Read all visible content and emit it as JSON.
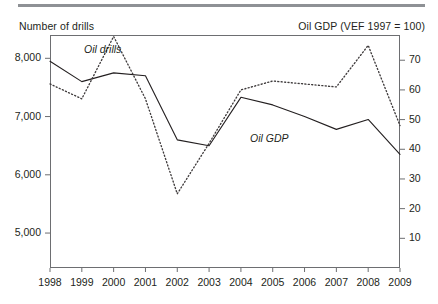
{
  "figure": {
    "left_axis_title": "Number of drills",
    "right_axis_title": "Oil GDP (VEF 1997 = 100)",
    "rule_color": "#8e9195",
    "frame_color": "#6d6e71",
    "series_label_oil_drills": "Oil drills",
    "series_label_oil_gdp": "Oil GDP"
  },
  "chart_data": {
    "type": "line",
    "title": "",
    "subtitle": "",
    "xlabel": "",
    "ylabel": "Number of drills",
    "y2label": "Oil GDP (VEF 1997 = 100)",
    "grid": false,
    "legend": "inline-annotations",
    "x": [
      1998,
      1999,
      2000,
      2001,
      2002,
      2003,
      2004,
      2005,
      2006,
      2007,
      2008,
      2009
    ],
    "xtick_labels": [
      "1998",
      "1999",
      "2000",
      "2001",
      "2002",
      "2003",
      "2004",
      "2005",
      "2006",
      "2007",
      "2008",
      "2009"
    ],
    "xlim": [
      1998,
      2009
    ],
    "ylim": [
      4400,
      8400
    ],
    "ytick_values": [
      5000,
      6000,
      7000,
      8000
    ],
    "ytick_labels": [
      "5,000",
      "6,000",
      "7,000",
      "8,000"
    ],
    "y2lim": [
      0,
      78.5
    ],
    "y2tick_values": [
      10,
      20,
      30,
      40,
      50,
      60,
      70
    ],
    "y2tick_labels": [
      "10",
      "20",
      "30",
      "40",
      "50",
      "60",
      "70"
    ],
    "series": [
      {
        "name": "Oil drills",
        "axis": "left",
        "style": "solid",
        "color": "#231f20",
        "values": [
          7950,
          7600,
          7750,
          7700,
          6600,
          6500,
          7330,
          7200,
          7000,
          6780,
          6950,
          6350
        ]
      },
      {
        "name": "Oil GDP",
        "axis": "right",
        "style": "dotted",
        "color": "#231f20",
        "values": [
          62,
          57,
          78,
          57,
          25,
          42,
          60,
          63,
          62,
          61,
          75,
          48
        ]
      }
    ]
  }
}
